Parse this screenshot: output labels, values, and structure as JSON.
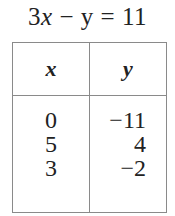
{
  "equation": {
    "coef": "3",
    "var1": "x",
    "op": " − ",
    "var2": "y",
    "eq": " = ",
    "rhs": "11"
  },
  "table": {
    "headers": [
      "x",
      "y"
    ],
    "rows": [
      {
        "x": "0",
        "y": "−11"
      },
      {
        "x": "5",
        "y": "4"
      },
      {
        "x": "3",
        "y": "−2"
      }
    ]
  }
}
